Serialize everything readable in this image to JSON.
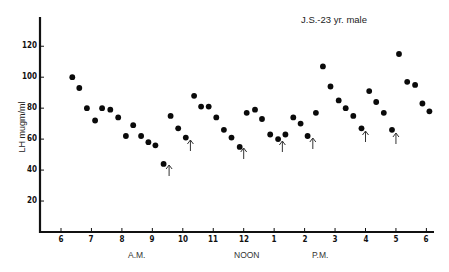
{
  "chart_data": {
    "type": "scatter",
    "title": "J.S.-23 yr. male",
    "xlabel": "",
    "ylabel": "LH mugm/ml",
    "x_tick_labels": [
      "6",
      "7",
      "8",
      "9",
      "10",
      "11",
      "12",
      "1",
      "2",
      "3",
      "4",
      "5",
      "6"
    ],
    "x_period_labels": [
      "A.M.",
      "NOON",
      "P.M."
    ],
    "y_tick_labels": [
      "20",
      "40",
      "60",
      "80",
      "100",
      "120"
    ],
    "ylim": [
      0,
      140
    ],
    "xlim_hours": [
      5.7,
      18.2
    ],
    "grid": false,
    "legend": null,
    "series": [
      {
        "name": "LH",
        "points": [
          {
            "t": 6.37,
            "v": 100
          },
          {
            "t": 6.6,
            "v": 93
          },
          {
            "t": 6.85,
            "v": 80
          },
          {
            "t": 7.12,
            "v": 72
          },
          {
            "t": 7.35,
            "v": 80
          },
          {
            "t": 7.62,
            "v": 79
          },
          {
            "t": 7.88,
            "v": 74
          },
          {
            "t": 8.13,
            "v": 62
          },
          {
            "t": 8.37,
            "v": 69
          },
          {
            "t": 8.63,
            "v": 62
          },
          {
            "t": 8.87,
            "v": 58
          },
          {
            "t": 9.1,
            "v": 56
          },
          {
            "t": 9.37,
            "v": 44
          },
          {
            "t": 9.6,
            "v": 75
          },
          {
            "t": 9.85,
            "v": 67
          },
          {
            "t": 10.1,
            "v": 61
          },
          {
            "t": 10.37,
            "v": 88
          },
          {
            "t": 10.6,
            "v": 81
          },
          {
            "t": 10.85,
            "v": 81
          },
          {
            "t": 11.1,
            "v": 74
          },
          {
            "t": 11.35,
            "v": 66
          },
          {
            "t": 11.6,
            "v": 61
          },
          {
            "t": 11.87,
            "v": 55
          },
          {
            "t": 12.1,
            "v": 77
          },
          {
            "t": 12.37,
            "v": 79
          },
          {
            "t": 12.6,
            "v": 73
          },
          {
            "t": 12.87,
            "v": 63
          },
          {
            "t": 13.13,
            "v": 60
          },
          {
            "t": 13.37,
            "v": 63
          },
          {
            "t": 13.63,
            "v": 74
          },
          {
            "t": 13.87,
            "v": 70
          },
          {
            "t": 14.1,
            "v": 62
          },
          {
            "t": 14.37,
            "v": 77
          },
          {
            "t": 14.6,
            "v": 107
          },
          {
            "t": 14.85,
            "v": 94
          },
          {
            "t": 15.12,
            "v": 85
          },
          {
            "t": 15.35,
            "v": 80
          },
          {
            "t": 15.6,
            "v": 75
          },
          {
            "t": 15.87,
            "v": 67
          },
          {
            "t": 16.12,
            "v": 91
          },
          {
            "t": 16.35,
            "v": 84
          },
          {
            "t": 16.6,
            "v": 77
          },
          {
            "t": 16.87,
            "v": 66
          },
          {
            "t": 17.1,
            "v": 115
          },
          {
            "t": 17.37,
            "v": 97
          },
          {
            "t": 17.63,
            "v": 95
          },
          {
            "t": 17.87,
            "v": 83
          },
          {
            "t": 18.1,
            "v": 78
          }
        ]
      }
    ],
    "annotations": [
      {
        "type": "arrow-up",
        "t": 9.55,
        "y_px_top": 165
      },
      {
        "type": "arrow-up",
        "t": 10.25,
        "y_px_top": 140
      },
      {
        "type": "arrow-up",
        "t": 12.0,
        "y_px_top": 148
      },
      {
        "type": "arrow-up",
        "t": 13.27,
        "y_px_top": 141
      },
      {
        "type": "arrow-up",
        "t": 14.27,
        "y_px_top": 138
      },
      {
        "type": "arrow-up",
        "t": 16.0,
        "y_px_top": 131
      },
      {
        "type": "arrow-up",
        "t": 17.0,
        "y_px_top": 133
      }
    ]
  },
  "layout": {
    "x0_px": 61,
    "px_per_hour": 30.45,
    "y0_px": 232,
    "px_per_unit": 1.548,
    "axis_left_px": 40,
    "axis_top_px": 17,
    "axis_right_px": 434
  }
}
